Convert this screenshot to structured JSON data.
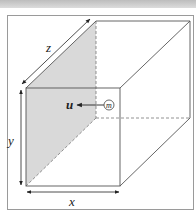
{
  "figure": {
    "labels": {
      "x": "x",
      "y": "y",
      "z": "z",
      "velocity": "u",
      "particle": "m"
    },
    "colors": {
      "edge": "#555555",
      "shaded_face": "#d9d9d9",
      "frame": "#9a9a9a",
      "top_band": "#c8c8c8"
    }
  }
}
